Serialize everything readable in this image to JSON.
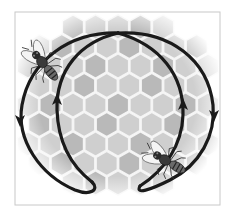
{
  "figure": {
    "background_color": "#ffffff",
    "frame": {
      "x": 15,
      "y": 12,
      "width": 205,
      "height": 193,
      "stroke": "#c8c8c8"
    },
    "honeycomb": {
      "cell_fill": "#cfcfcf",
      "cell_fill_dark": "#b9b9b9",
      "cell_outline": "#f4f4f4",
      "cell_radius": 13,
      "center": [
        118,
        105
      ],
      "fade_radius": 100
    },
    "path": {
      "stroke": "#1a1a1a",
      "stroke_width": 3.2,
      "arrows": [
        {
          "name": "left-outer-down",
          "x": 20,
          "y": 120,
          "direction": "down"
        },
        {
          "name": "left-inner-up",
          "x": 57,
          "y": 100,
          "direction": "up"
        },
        {
          "name": "right-inner-up",
          "x": 183,
          "y": 105,
          "direction": "up"
        },
        {
          "name": "right-outer-down",
          "x": 214,
          "y": 115,
          "direction": "down"
        }
      ]
    },
    "bees": [
      {
        "name": "bee-top-left",
        "x": 42,
        "y": 62,
        "rotation": -40
      },
      {
        "name": "bee-bottom-right",
        "x": 165,
        "y": 160,
        "rotation": -60
      }
    ]
  }
}
